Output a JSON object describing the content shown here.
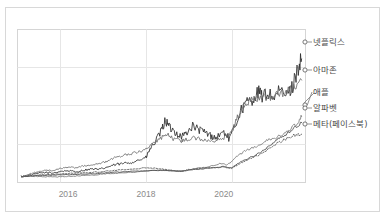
{
  "chart_data": {
    "type": "line",
    "title": "",
    "subtitle": "",
    "xlabel": "",
    "ylabel": "",
    "grid": true,
    "legend_position": "right-inline-labels",
    "xlim": [
      2014.7,
      2022.1
    ],
    "ylim": [
      0,
      26
    ],
    "xticks": [
      "2016",
      "2018",
      "2020"
    ],
    "xtick_values": [
      2016,
      2018,
      2020
    ],
    "yticks": [],
    "note": "Indexed cumulative stock price growth, normalized to 1 at start (2014-15).",
    "series": [
      {
        "name": "넷플릭스",
        "color": "#2b2b2b",
        "style": "solid",
        "end_value": 21.0,
        "x": [
          2014.8,
          2015.0,
          2015.2,
          2015.4,
          2015.6,
          2015.8,
          2016.0,
          2016.2,
          2016.4,
          2016.6,
          2016.8,
          2017.0,
          2017.2,
          2017.4,
          2017.6,
          2017.8,
          2018.0,
          2018.1,
          2018.25,
          2018.4,
          2018.5,
          2018.6,
          2018.75,
          2018.9,
          2019.0,
          2019.2,
          2019.35,
          2019.5,
          2019.65,
          2019.8,
          2020.0,
          2020.15,
          2020.3,
          2020.45,
          2020.6,
          2020.75,
          2020.9,
          2021.0,
          2021.15,
          2021.3,
          2021.45,
          2021.6,
          2021.75,
          2021.9,
          2022.0
        ],
        "y": [
          1.0,
          1.2,
          1.5,
          1.7,
          1.6,
          1.9,
          2.0,
          1.8,
          2.1,
          2.3,
          2.2,
          2.6,
          3.0,
          3.2,
          3.4,
          3.8,
          4.2,
          5.6,
          7.0,
          8.8,
          10.6,
          9.4,
          8.6,
          7.8,
          8.2,
          9.6,
          9.0,
          8.6,
          8.0,
          7.6,
          8.6,
          7.4,
          9.8,
          12.4,
          13.6,
          14.2,
          15.4,
          14.6,
          15.2,
          14.4,
          15.6,
          14.8,
          16.0,
          19.4,
          21.0
        ]
      },
      {
        "name": "아마존",
        "color": "#6e6e6e",
        "style": "solid",
        "end_value": 17.4,
        "x": [
          2014.8,
          2015.0,
          2015.2,
          2015.4,
          2015.6,
          2015.8,
          2016.0,
          2016.2,
          2016.4,
          2016.6,
          2016.8,
          2017.0,
          2017.2,
          2017.4,
          2017.6,
          2017.8,
          2018.0,
          2018.2,
          2018.4,
          2018.55,
          2018.7,
          2018.9,
          2019.0,
          2019.2,
          2019.4,
          2019.6,
          2019.8,
          2020.0,
          2020.2,
          2020.35,
          2020.5,
          2020.65,
          2020.8,
          2021.0,
          2021.2,
          2021.4,
          2021.6,
          2021.8,
          2022.0
        ],
        "y": [
          1.0,
          1.4,
          1.8,
          2.1,
          2.0,
          2.4,
          2.6,
          2.5,
          2.8,
          3.0,
          3.2,
          3.6,
          4.2,
          4.6,
          4.8,
          5.2,
          5.6,
          6.6,
          7.6,
          8.2,
          7.4,
          7.0,
          7.2,
          7.6,
          7.4,
          7.0,
          7.2,
          7.6,
          8.4,
          11.2,
          13.0,
          13.8,
          14.2,
          14.6,
          14.4,
          15.0,
          15.4,
          16.2,
          17.4
        ]
      },
      {
        "name": "애플",
        "color": "#7a7a7a",
        "style": "solid",
        "end_value": 11.2,
        "x": [
          2014.8,
          2015.0,
          2015.3,
          2015.6,
          2015.9,
          2016.1,
          2016.4,
          2016.7,
          2017.0,
          2017.3,
          2017.6,
          2017.9,
          2018.2,
          2018.5,
          2018.8,
          2019.0,
          2019.3,
          2019.6,
          2019.9,
          2020.1,
          2020.3,
          2020.5,
          2020.7,
          2020.9,
          2021.1,
          2021.3,
          2021.5,
          2021.7,
          2021.9,
          2022.0
        ],
        "y": [
          1.0,
          1.1,
          1.0,
          0.95,
          1.0,
          1.05,
          1.2,
          1.3,
          1.5,
          1.6,
          1.7,
          1.9,
          2.0,
          2.1,
          1.9,
          2.0,
          2.4,
          2.7,
          3.2,
          3.0,
          4.2,
          5.2,
          5.8,
          6.2,
          7.2,
          7.4,
          8.2,
          9.0,
          10.2,
          11.2
        ]
      },
      {
        "name": "알파벳",
        "color": "#4a4a4a",
        "style": "solid",
        "end_value": 10.2,
        "x": [
          2014.8,
          2015.0,
          2015.3,
          2015.6,
          2015.9,
          2016.2,
          2016.5,
          2016.8,
          2017.1,
          2017.4,
          2017.7,
          2018.0,
          2018.3,
          2018.6,
          2018.9,
          2019.1,
          2019.4,
          2019.7,
          2020.0,
          2020.2,
          2020.4,
          2020.6,
          2020.8,
          2021.0,
          2021.2,
          2021.4,
          2021.6,
          2021.8,
          2022.0
        ],
        "y": [
          1.0,
          1.1,
          1.2,
          1.25,
          1.3,
          1.4,
          1.45,
          1.55,
          1.7,
          1.8,
          1.9,
          2.0,
          2.1,
          2.0,
          1.9,
          2.1,
          2.3,
          2.5,
          2.7,
          2.5,
          3.4,
          4.0,
          4.6,
          5.4,
          6.4,
          7.4,
          8.2,
          9.2,
          10.2
        ]
      },
      {
        "name": "메타(페이스북)",
        "color": "#5c5c5c",
        "style": "dotted",
        "end_value": 8.2,
        "x": [
          2014.8,
          2015.0,
          2015.3,
          2015.6,
          2015.9,
          2016.2,
          2016.5,
          2016.8,
          2017.1,
          2017.4,
          2017.7,
          2018.0,
          2018.3,
          2018.6,
          2018.9,
          2019.1,
          2019.4,
          2019.7,
          2020.0,
          2020.2,
          2020.4,
          2020.6,
          2020.8,
          2021.0,
          2021.2,
          2021.4,
          2021.6,
          2021.8,
          2022.0
        ],
        "y": [
          1.0,
          1.15,
          1.3,
          1.35,
          1.5,
          1.6,
          1.7,
          1.8,
          2.0,
          2.2,
          2.3,
          2.5,
          2.4,
          2.1,
          1.9,
          2.2,
          2.4,
          2.5,
          2.6,
          2.4,
          3.2,
          3.8,
          4.4,
          5.0,
          6.0,
          6.8,
          7.4,
          8.0,
          8.2
        ]
      }
    ],
    "labels": [
      {
        "text": "넷플릭스",
        "marker_x": 305,
        "marker_y": 42,
        "text_x": 313,
        "text_y": 45
      },
      {
        "text": "아마존",
        "marker_x": 305,
        "marker_y": 70,
        "text_x": 313,
        "text_y": 73
      },
      {
        "text": "애플",
        "marker_x": 305,
        "marker_y": 105,
        "text_x": 313,
        "text_y": 95
      },
      {
        "text": "알파벳",
        "marker_x": 305,
        "marker_y": 108,
        "text_x": 313,
        "text_y": 111
      },
      {
        "text": "메타(페이스북)",
        "marker_x": 305,
        "marker_y": 124,
        "text_x": 313,
        "text_y": 127
      }
    ],
    "colors": {
      "grid": "#e2e2e2",
      "axis": "#cccccc",
      "frame": "#d8d8d8",
      "tick_text": "#8a8a8a",
      "label_text": "#4a4a4a",
      "background": "#ffffff"
    }
  }
}
